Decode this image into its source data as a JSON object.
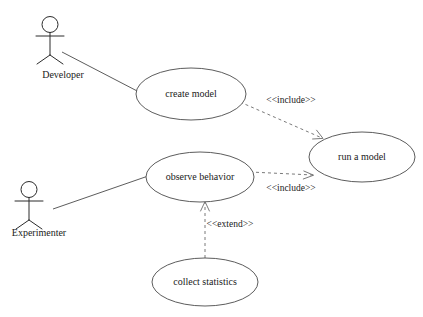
{
  "diagram": {
    "type": "uml-use-case-diagram",
    "actors": [
      {
        "id": "developer",
        "label": "Developer",
        "label_x": 63,
        "label_y": 78,
        "head_cx": 50,
        "head_cy": 24.5,
        "head_r": 8,
        "body_top_y": 32,
        "body_bottom_y": 55,
        "arm_y": 36,
        "arm_left_x": 36,
        "arm_right_x": 64,
        "leg_left_x": 36,
        "leg_right_x": 64,
        "leg_y": 63
      },
      {
        "id": "experimenter",
        "label": "Experimenter",
        "label_x": 29,
        "label_y": 236,
        "head_cx": 29,
        "head_cy": 189.5,
        "head_r": 8,
        "body_top_y": 197,
        "body_bottom_y": 220,
        "arm_y": 201,
        "arm_left_x": 15,
        "arm_right_x": 43,
        "leg_left_x": 15,
        "leg_right_x": 43,
        "leg_y": 228
      }
    ],
    "use_cases": [
      {
        "id": "create-model",
        "label": "create model",
        "cx": 191,
        "cy": 94,
        "rx": 55,
        "ry": 26
      },
      {
        "id": "run-a-model",
        "label": "run a model",
        "cx": 362,
        "cy": 157,
        "rx": 53,
        "ry": 25
      },
      {
        "id": "observe-behavior",
        "label": "observe behavior",
        "cx": 200,
        "cy": 177,
        "rx": 54,
        "ry": 25
      },
      {
        "id": "collect-statistics",
        "label": "collect statistics",
        "cx": 205,
        "cy": 282,
        "rx": 53,
        "ry": 24
      }
    ],
    "associations": [
      {
        "id": "developer-to-create-model",
        "from": "developer",
        "to": "create-model",
        "x1": 62,
        "y1": 52,
        "x2": 141,
        "y2": 93
      },
      {
        "id": "experimenter-to-observe-behavior",
        "from": "experimenter",
        "to": "observe-behavior",
        "x1": 53,
        "y1": 209,
        "x2": 151,
        "y2": 175
      }
    ],
    "dependencies": [
      {
        "id": "create-model-include-run-a-model",
        "stereotype": "<<include>>",
        "from": "create-model",
        "to": "run-a-model",
        "x1": 240,
        "y1": 102,
        "x2": 322,
        "y2": 138,
        "label_x": 291,
        "label_y": 103,
        "arrow_angle_deg": 23.7
      },
      {
        "id": "observe-behavior-include-run-a-model",
        "stereotype": "<<include>>",
        "from": "observe-behavior",
        "to": "run-a-model",
        "x1": 250,
        "y1": 172,
        "x2": 313,
        "y2": 175,
        "label_x": 291,
        "label_y": 191,
        "arrow_angle_deg": 2.7
      },
      {
        "id": "collect-statistics-extend-observe-behavior",
        "stereotype": "<<extend>>",
        "from": "collect-statistics",
        "to": "observe-behavior",
        "x1": 205,
        "y1": 258,
        "x2": 205,
        "y2": 202,
        "label_x": 230,
        "label_y": 227,
        "arrow_angle_deg": -90
      }
    ],
    "colors": {
      "background": "#ffffff",
      "shape_stroke": "#4a4a4a",
      "actor_stroke": "#2b2b2b",
      "dependency_stroke": "#6b6b6b",
      "text": "#1a1a1a"
    }
  }
}
